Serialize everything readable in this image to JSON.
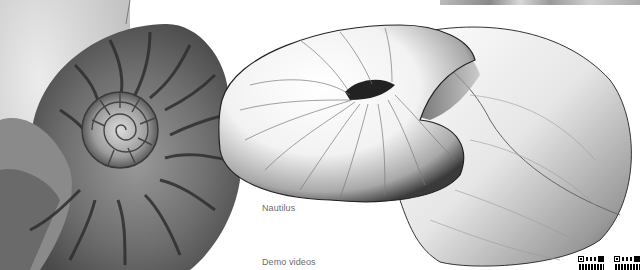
{
  "labels": {
    "nautilus": "Nautilus",
    "demo_videos": "Demo videos"
  },
  "images": [
    {
      "name": "nautilus-shell-photo",
      "description": "Grayscale photograph of a cross-sectioned nautilus shell"
    },
    {
      "name": "nautilus-3d-render",
      "description": "Rendered 3D model of a nautilus-like spiral surface"
    }
  ],
  "qr_codes": [
    {
      "name": "qr-code-1"
    },
    {
      "name": "qr-code-2"
    }
  ],
  "colors": {
    "background": "#ffffff",
    "text": "#6b6b6b"
  }
}
